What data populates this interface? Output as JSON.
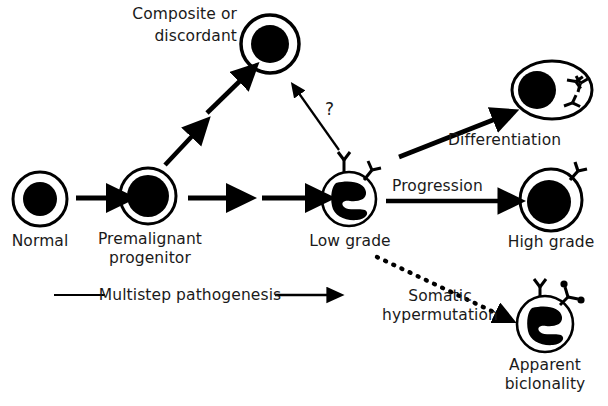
{
  "figure": {
    "background_color": "#ffffff",
    "ink_color": "#000000",
    "text_color": "#1a1a1a"
  },
  "cells": {
    "normal": {
      "label": "Normal",
      "shape": "circle",
      "nucleus": "round-central",
      "markers": 0,
      "cx": 40,
      "cy": 199,
      "r": 27
    },
    "premalignant": {
      "label": "Premalignant\nprogenitor",
      "label_line1": "Premalignant",
      "label_line2": "progenitor",
      "shape": "circle",
      "nucleus": "round-central-large",
      "markers": 0,
      "cx": 148,
      "cy": 196,
      "r": 28
    },
    "composite": {
      "label": "Composite or\ndiscordant",
      "label_line1": "Composite or",
      "label_line2": "discordant",
      "shape": "circle",
      "nucleus": "round-central",
      "markers": 0,
      "cx": 270,
      "cy": 44,
      "r": 29
    },
    "low_grade": {
      "label": "Low grade",
      "shape": "circle",
      "nucleus": "irregular-cleaved",
      "markers": 2,
      "marker_type": "plain-Y",
      "cx": 349,
      "cy": 199,
      "r": 27
    },
    "differentiated": {
      "label": "Differentiation",
      "shape": "ellipse",
      "nucleus": "round-eccentric",
      "markers": 4,
      "marker_type": "internal-immunoglobulin",
      "cx": 552,
      "cy": 90,
      "rx": 40,
      "ry": 29
    },
    "high_grade": {
      "label": "High grade",
      "shape": "circle",
      "nucleus": "round-central-large",
      "markers": 1,
      "marker_type": "plain-Y",
      "cx": 551,
      "cy": 200,
      "r": 31
    },
    "biclonal": {
      "label": "Apparent\nbiclonality",
      "label_line1": "Apparent",
      "label_line2": "biclonality",
      "shape": "circle",
      "nucleus": "irregular-cleaved",
      "markers": 2,
      "marker_type": "plain-Y-and-dotted-Y",
      "cx": 545,
      "cy": 324,
      "r": 28
    }
  },
  "arrows": {
    "normal_to_premalignant": {
      "style": "thick-solid",
      "label": ""
    },
    "premalignant_to_mid": {
      "style": "thick-solid",
      "label": ""
    },
    "mid_to_lowgrade": {
      "style": "thick-solid",
      "label": ""
    },
    "premalignant_to_composite_a": {
      "style": "thick-solid-diagonal",
      "label": ""
    },
    "premalignant_to_composite_b": {
      "style": "thick-solid-diagonal",
      "label": ""
    },
    "lowgrade_to_composite": {
      "style": "thin-solid-diagonal",
      "label": "?"
    },
    "lowgrade_to_differentiated": {
      "style": "thick-solid-diagonal",
      "label": "Differentiation"
    },
    "lowgrade_to_highgrade": {
      "style": "thick-solid",
      "label": "Progression"
    },
    "lowgrade_to_biclonal": {
      "style": "dotted",
      "label": "Somatic\nhypermutation",
      "label_line1": "Somatic",
      "label_line2": "hypermutation"
    }
  },
  "annotations": {
    "multistep": {
      "text": "Multistep pathogenesis",
      "left_rule": true,
      "right_arrow": true
    },
    "question": "?"
  }
}
